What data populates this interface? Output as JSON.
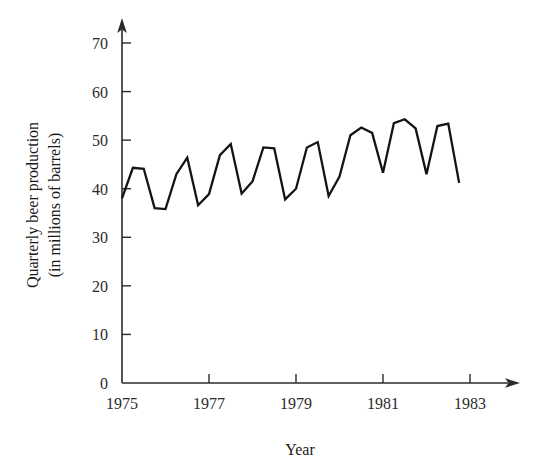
{
  "chart_data": {
    "type": "line",
    "title": "",
    "xlabel": "Year",
    "ylabel": "Quarterly beer production (in millions of barrels)",
    "ylabel_line1": "Quarterly beer production",
    "ylabel_line2": "(in millions of barrels)",
    "grid": false,
    "legend": false,
    "xlim": [
      1975.0,
      1983.0
    ],
    "ylim": [
      0,
      70
    ],
    "yticks": [
      0,
      10,
      20,
      30,
      40,
      50,
      60,
      70
    ],
    "ytick_labels": [
      "0",
      "10",
      "20",
      "30",
      "40",
      "50",
      "60",
      "70"
    ],
    "xticks": [
      1975,
      1977,
      1979,
      1981,
      1983
    ],
    "xtick_labels": [
      "1975",
      "1977",
      "1979",
      "1981",
      "1983"
    ],
    "x": [
      1975.0,
      1975.25,
      1975.5,
      1975.75,
      1976.0,
      1976.25,
      1976.5,
      1976.75,
      1977.0,
      1977.25,
      1977.5,
      1977.75,
      1978.0,
      1978.25,
      1978.5,
      1978.75,
      1979.0,
      1979.25,
      1979.5,
      1979.75,
      1980.0,
      1980.25,
      1980.5,
      1980.75,
      1981.0,
      1981.25,
      1981.5,
      1981.75,
      1982.0,
      1982.25,
      1982.5,
      1982.75
    ],
    "x_quarter_labels": [
      "1975 Q1",
      "1975 Q2",
      "1975 Q3",
      "1975 Q4",
      "1976 Q1",
      "1976 Q2",
      "1976 Q3",
      "1976 Q4",
      "1977 Q1",
      "1977 Q2",
      "1977 Q3",
      "1977 Q4",
      "1978 Q1",
      "1978 Q2",
      "1978 Q3",
      "1978 Q4",
      "1979 Q1",
      "1979 Q2",
      "1979 Q3",
      "1979 Q4",
      "1980 Q1",
      "1980 Q2",
      "1980 Q3",
      "1980 Q4",
      "1981 Q1",
      "1981 Q2",
      "1981 Q3",
      "1981 Q4",
      "1982 Q1",
      "1982 Q2",
      "1982 Q3",
      "1982 Q4"
    ],
    "values": [
      38.0,
      44.3,
      44.1,
      36.0,
      35.8,
      43.0,
      46.4,
      36.6,
      38.9,
      46.9,
      49.2,
      39.0,
      41.5,
      48.5,
      48.3,
      37.8,
      40.0,
      48.5,
      49.6,
      38.5,
      42.5,
      51.0,
      52.6,
      51.5,
      43.3,
      53.5,
      54.3,
      52.4,
      43.0,
      52.9,
      53.4,
      41.2
    ],
    "series": [
      {
        "name": "Quarterly beer production",
        "values": [
          38.0,
          44.3,
          44.1,
          36.0,
          35.8,
          43.0,
          46.4,
          36.6,
          38.9,
          46.9,
          49.2,
          39.0,
          41.5,
          48.5,
          48.3,
          37.8,
          40.0,
          48.5,
          49.6,
          38.5,
          42.5,
          51.0,
          52.6,
          51.5,
          43.3,
          53.5,
          54.3,
          52.4,
          43.0,
          52.9,
          53.4,
          41.2
        ],
        "color": "#141414"
      }
    ],
    "annotations": [],
    "colors": {
      "line": "#141414",
      "axis": "#2b2b2b",
      "text": "#1a1a1a",
      "background": "#ffffff"
    }
  }
}
